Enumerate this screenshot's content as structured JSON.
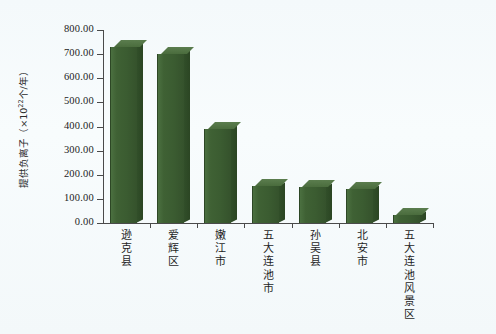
{
  "figure": {
    "background_color": "#f7fbfc",
    "bar_color": "#3f6134",
    "axis_color": "#4a4a4a"
  },
  "axis": {
    "y_title_main": "提供负离子（×10",
    "y_title_exp": "22",
    "y_title_tail": "个/年）",
    "y_title_full": "提供负离子（×10²² 个/年）",
    "y_ticks": [
      "0.00",
      "100.00",
      "200.00",
      "300.00",
      "400.00",
      "500.00",
      "600.00",
      "700.00",
      "800.00"
    ],
    "y_min": 0,
    "y_max": 800,
    "y_step": 100
  },
  "chart_data": {
    "type": "bar",
    "title": "",
    "xlabel": "",
    "ylabel": "提供负离子（×10²² 个/年）",
    "categories": [
      "逊克县",
      "爱辉区",
      "嫩江市",
      "五大连池市",
      "孙吴县",
      "北安市",
      "五大连池风景区"
    ],
    "values": [
      730,
      700,
      390,
      155,
      150,
      140,
      35
    ],
    "ylim": [
      0,
      800
    ],
    "ytick_labels": [
      "0.00",
      "100.00",
      "200.00",
      "300.00",
      "400.00",
      "500.00",
      "600.00",
      "700.00",
      "800.00"
    ],
    "grid": false,
    "legend": "none",
    "series": [
      {
        "name": "提供负离子",
        "values": [
          730,
          700,
          390,
          155,
          150,
          140,
          35
        ],
        "color": "#3f6134"
      }
    ]
  }
}
